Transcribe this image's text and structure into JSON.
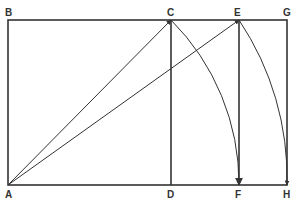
{
  "diagram": {
    "labels": {
      "A": "A",
      "B": "B",
      "C": "C",
      "D": "D",
      "E": "E",
      "F": "F",
      "G": "G",
      "H": "H"
    },
    "points": {
      "A": [
        8,
        185
      ],
      "B": [
        8,
        20
      ],
      "C": [
        171,
        20
      ],
      "D": [
        171,
        185
      ],
      "E": [
        239,
        20
      ],
      "F": [
        239,
        185
      ],
      "G": [
        287,
        20
      ],
      "H": [
        287,
        185
      ]
    },
    "colors": {
      "line": "#333333",
      "background": "#ffffff"
    }
  }
}
